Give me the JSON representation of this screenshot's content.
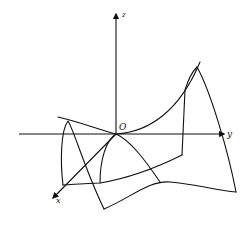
{
  "figure": {
    "type": "saddle-surface-3d-axes",
    "labels": {
      "z_axis": "z",
      "y_axis": "y",
      "x_axis": "x",
      "origin": "O"
    },
    "colors": {
      "stroke": "#111111",
      "background": "#ffffff"
    }
  }
}
